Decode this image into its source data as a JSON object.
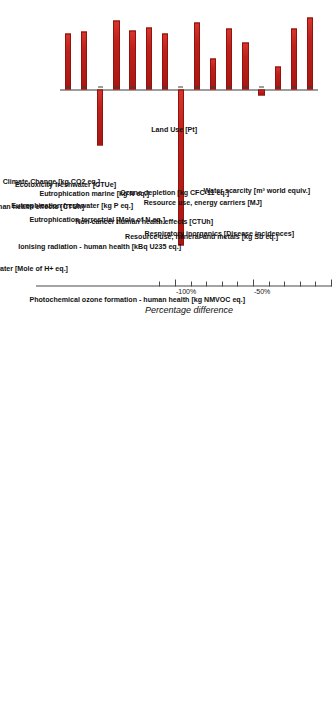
{
  "chart_data": {
    "type": "bar",
    "title": "",
    "subtitle": "",
    "orientation": "horizontal",
    "xlabel": "",
    "ylabel": "Percentage difference",
    "value_axis_title": "Percentage difference",
    "grid": false,
    "legend": null,
    "axis_range": [
      -110,
      62
    ],
    "tick_labels": [
      "50%",
      "0%",
      "-50%",
      "-100%"
    ],
    "tick_values": [
      50,
      0,
      -50,
      -100
    ],
    "minor_tick_step": 10,
    "bar_color": "#c0201b",
    "bar_edge_color": "#8e1410",
    "axis_color": "#4a4a4a",
    "categories": [
      "Water scarcity [m³ world equiv.]",
      "Respiratory inorganics [Disease incidences]",
      "Resource use, mineral and metals [kg Sb eq.]",
      "Resource use, energy carriers [MJ]",
      "Photochemical ozone formation - human health [kg NMVOC eq.]",
      "Ozone depletion [kg CFC-11 eq.]",
      "Non-cancer human health effects [CTUh]",
      "Land Use [Pt]",
      "Ionising radiation - human health [kBq U235 eq.]",
      "Eutrophication terrestrial [Mole of N eq.]",
      "Eutrophication marine [kg N eq.]",
      "Eutrophication freshwater [kg P eq.]",
      "Ecotoxicity freshwater [CTUe]",
      "Climate Change [kg CO2 eq.]",
      "Cancer human health effects [CTUh]",
      "Acidification terrestrial and freshwater [Mole of H+ eq.]"
    ],
    "values": [
      46,
      39,
      15,
      -4,
      30,
      39,
      20,
      43,
      -100,
      36,
      40,
      38,
      44,
      -36,
      37,
      36
    ]
  }
}
